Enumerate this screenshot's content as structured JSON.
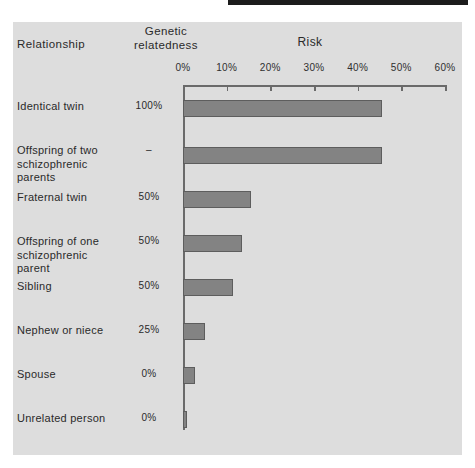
{
  "figure": {
    "headers": {
      "relationship": "Relationship",
      "genetic_line1": "Genetic",
      "genetic_line2": "relatedness",
      "risk": "Risk"
    },
    "colors": {
      "panel_background": "#dddddd",
      "bar_fill": "#838383",
      "bar_border": "#5d5d5d",
      "axis": "#6a6a6a",
      "text": "#2a2a2a",
      "top_rule": "#1c1c1c"
    }
  },
  "chart_data": {
    "type": "bar",
    "orientation": "horizontal",
    "title": "",
    "xlabel": "Risk",
    "ylabel": "Relationship",
    "xlim": [
      0,
      60
    ],
    "grid": false,
    "legend": null,
    "tick_labels": [
      "0%",
      "10%",
      "20%",
      "30%",
      "40%",
      "50%",
      "60%"
    ],
    "tick_values": [
      0,
      10,
      20,
      30,
      40,
      50,
      60
    ],
    "categories": [
      "Identical twin",
      "Offspring of two schizophrenic parents",
      "Fraternal twin",
      "Offspring of one schizophrenic parent",
      "Sibling",
      "Nephew or niece",
      "Spouse",
      "Unrelated person"
    ],
    "category_lines": [
      [
        "Identical twin"
      ],
      [
        "Offspring  of two",
        "schizophrenic parents"
      ],
      [
        "Fraternal twin"
      ],
      [
        "Offspring  of one",
        "schizophrenic parent"
      ],
      [
        "Sibling"
      ],
      [
        "Nephew or niece"
      ],
      [
        "Spouse"
      ],
      [
        "Unrelated person"
      ]
    ],
    "genetic_relatedness": [
      "100%",
      "–",
      "50%",
      "50%",
      "50%",
      "25%",
      "0%",
      "0%"
    ],
    "values": [
      45.5,
      45.5,
      15.5,
      13.5,
      11.5,
      5.0,
      2.8,
      1.0
    ],
    "ylabel_column_header": "Genetic relatedness"
  }
}
